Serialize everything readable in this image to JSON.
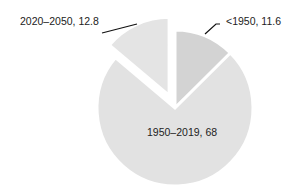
{
  "chart_data": {
    "type": "pie",
    "title": "",
    "slices": [
      {
        "label": "<1950",
        "value": 11.6,
        "color": "#d3d3d3",
        "exploded": false,
        "display": "<1950, 11.6"
      },
      {
        "label": "1950–2019",
        "value": 68,
        "color": "#e2e2e2",
        "exploded": false,
        "display": "1950–2019, 68"
      },
      {
        "label": "2020–2050",
        "value": 12.8,
        "color": "#e4e4e4",
        "exploded": true,
        "display": "2020–2050, 12.8"
      }
    ],
    "start_angle": "top, clockwise",
    "legend": "none"
  },
  "labels": {
    "slice0": "<1950, 11.6",
    "slice1": "1950–2019, 68",
    "slice2": "2020–2050, 12.8"
  }
}
